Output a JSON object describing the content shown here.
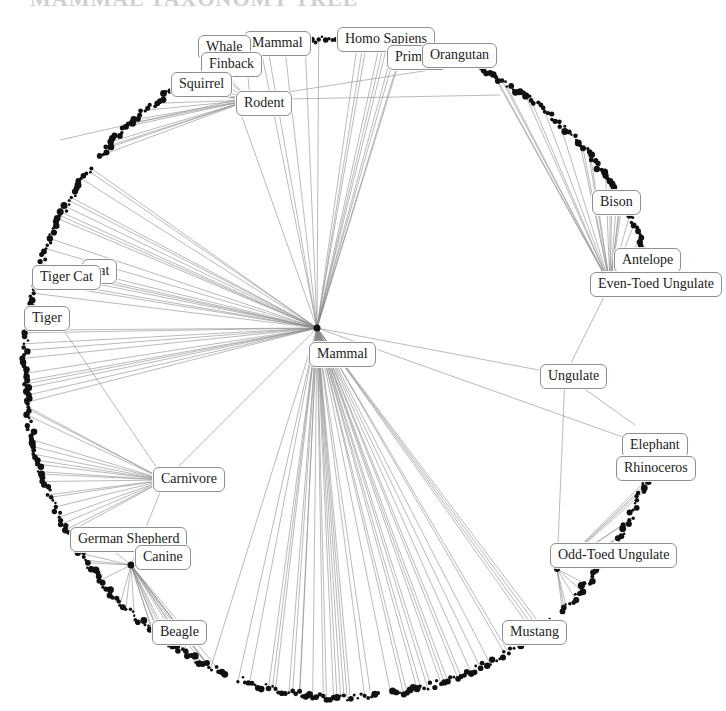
{
  "diagram": {
    "title_fragment": "MAMMAL TAXONOMY TREE",
    "type": "radial-tree",
    "root": "Mammal",
    "colors": {
      "edge": "#8a8a8a",
      "leaf": "#111111",
      "label_border": "#8f8f8f",
      "label_text": "#222222",
      "background": "#ffffff"
    },
    "labels": [
      {
        "id": "homo-sapiens",
        "text": "Homo Sapiens",
        "x": 337,
        "y": 27
      },
      {
        "id": "primate",
        "text": "Primate",
        "x": 387,
        "y": 45
      },
      {
        "id": "orangutan",
        "text": "Orangutan",
        "x": 422,
        "y": 43
      },
      {
        "id": "mammal-top",
        "text": "Mammal",
        "x": 244,
        "y": 31
      },
      {
        "id": "whale",
        "text": "Whale",
        "x": 198,
        "y": 35
      },
      {
        "id": "finback",
        "text": "Finback",
        "x": 201,
        "y": 52
      },
      {
        "id": "squirrel",
        "text": "Squirrel",
        "x": 171,
        "y": 72
      },
      {
        "id": "rodent",
        "text": "Rodent",
        "x": 236,
        "y": 91
      },
      {
        "id": "bison",
        "text": "Bison",
        "x": 592,
        "y": 190
      },
      {
        "id": "antelope",
        "text": "Antelope",
        "x": 614,
        "y": 248
      },
      {
        "id": "even-toed-ungulate",
        "text": "Even-Toed Ungulate",
        "x": 590,
        "y": 272
      },
      {
        "id": "cat",
        "text": "Cat",
        "x": 82,
        "y": 259
      },
      {
        "id": "tiger-cat",
        "text": "Tiger Cat",
        "x": 32,
        "y": 265
      },
      {
        "id": "tiger",
        "text": "Tiger",
        "x": 24,
        "y": 306
      },
      {
        "id": "mammal",
        "text": "Mammal",
        "x": 309,
        "y": 342
      },
      {
        "id": "ungulate",
        "text": "Ungulate",
        "x": 540,
        "y": 364
      },
      {
        "id": "elephant",
        "text": "Elephant",
        "x": 622,
        "y": 433
      },
      {
        "id": "rhinoceros",
        "text": "Rhinoceros",
        "x": 616,
        "y": 456
      },
      {
        "id": "carnivore",
        "text": "Carnivore",
        "x": 153,
        "y": 467
      },
      {
        "id": "german-shepherd",
        "text": "German Shepherd",
        "x": 70,
        "y": 527
      },
      {
        "id": "canine",
        "text": "Canine",
        "x": 135,
        "y": 545
      },
      {
        "id": "odd-toed-ungulate",
        "text": "Odd-Toed Ungulate",
        "x": 550,
        "y": 543
      },
      {
        "id": "beagle",
        "text": "Beagle",
        "x": 152,
        "y": 620
      },
      {
        "id": "mustang",
        "text": "Mustang",
        "x": 502,
        "y": 620
      }
    ],
    "hubs": [
      {
        "id": "mammal-hub",
        "x": 317,
        "y": 328,
        "r": 3.5
      },
      {
        "id": "canine-hub",
        "x": 131,
        "y": 565,
        "r": 3.5
      },
      {
        "id": "odd-toed-hub",
        "x": 557,
        "y": 569,
        "r": 3
      }
    ]
  }
}
